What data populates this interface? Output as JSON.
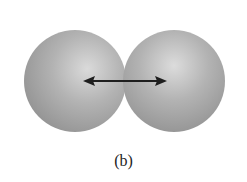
{
  "figure": {
    "label": "(b)",
    "colors": {
      "sphere_highlight": "#d8d8d8",
      "sphere_mid": "#a9a9a9",
      "sphere_shadow": "#8a8a8a",
      "arrow": "#1e1e1e",
      "background": "#ffffff"
    }
  }
}
